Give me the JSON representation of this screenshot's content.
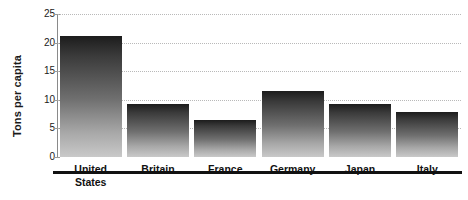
{
  "chart_data": {
    "type": "bar",
    "title": "",
    "xlabel": "",
    "ylabel": "Tons per capita",
    "categories": [
      "United States",
      "Britain",
      "France",
      "Germany",
      "Japan",
      "Italy"
    ],
    "category_lines": [
      [
        "United",
        "States"
      ],
      [
        "Britain"
      ],
      [
        "France"
      ],
      [
        "Germany"
      ],
      [
        "Japan"
      ],
      [
        "Italy"
      ]
    ],
    "values": [
      21.2,
      9.2,
      6.4,
      11.5,
      9.2,
      7.8
    ],
    "ylim": [
      0,
      25
    ],
    "yticks": [
      0,
      5,
      10,
      15,
      20,
      25
    ],
    "ytick_labels": [
      "0",
      "5",
      "10",
      "15",
      "20",
      "25"
    ],
    "grid": "horizontal-dotted",
    "legend": "none",
    "bar_fill": "#6f6f6f",
    "bar_gradient_top": "#1c1c1c",
    "bar_gradient_bottom": "#c9c9c9",
    "axis_color": "#8a8a8a",
    "baseline_color": "#111111",
    "gridline_color": "#b9b9b9",
    "text_color": "#111111",
    "background": "#ffffff"
  }
}
